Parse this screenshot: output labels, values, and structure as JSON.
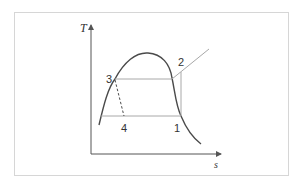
{
  "diagram": {
    "type": "T-s diagram (vapor-compression refrigeration cycle)",
    "axes": {
      "y_label": "T",
      "x_label": "s"
    },
    "state_points": [
      {
        "id": "1",
        "label": "1"
      },
      {
        "id": "2",
        "label": "2"
      },
      {
        "id": "3",
        "label": "3"
      },
      {
        "id": "4",
        "label": "4"
      }
    ],
    "colors": {
      "dome": "#4a4a4a",
      "cycle_lines": "#a8a8a8",
      "axes": "#555555",
      "frame": "#d6d6d6"
    }
  }
}
